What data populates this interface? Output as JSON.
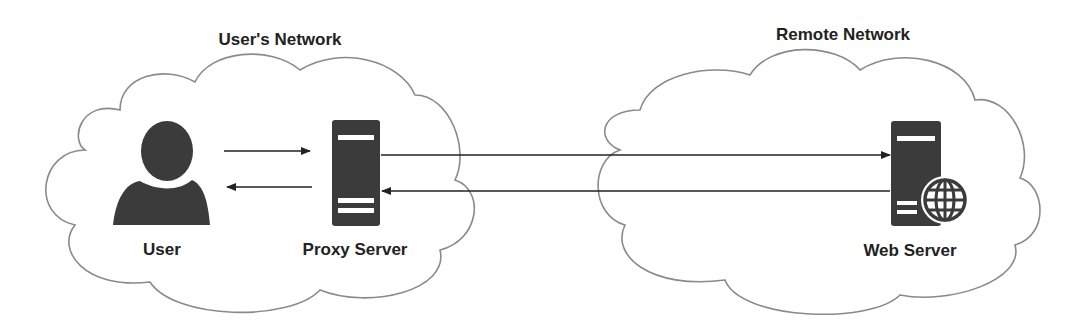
{
  "diagram": {
    "networks": [
      {
        "id": "users-network",
        "title": "User's Network"
      },
      {
        "id": "remote-network",
        "title": "Remote Network"
      }
    ],
    "nodes": [
      {
        "id": "user",
        "label": "User",
        "icon": "user-icon",
        "network": "users-network"
      },
      {
        "id": "proxy-server",
        "label": "Proxy Server",
        "icon": "server-icon",
        "network": "users-network"
      },
      {
        "id": "web-server",
        "label": "Web Server",
        "icon": "web-server-globe-icon",
        "network": "remote-network"
      }
    ],
    "edges": [
      {
        "from": "user",
        "to": "proxy-server",
        "direction": "right"
      },
      {
        "from": "proxy-server",
        "to": "user",
        "direction": "left"
      },
      {
        "from": "proxy-server",
        "to": "web-server",
        "direction": "right"
      },
      {
        "from": "web-server",
        "to": "proxy-server",
        "direction": "left"
      }
    ],
    "colors": {
      "icon": "#3b3b3b",
      "cloud_stroke": "#8a8a8a",
      "arrow": "#222222",
      "text": "#222222"
    }
  }
}
